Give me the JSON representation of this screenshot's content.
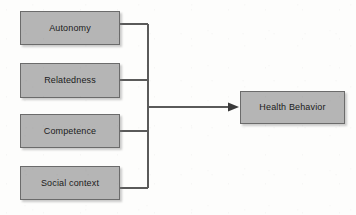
{
  "diagram": {
    "type": "flow-diagram",
    "background_color": "#fdfdfc",
    "node_fill_color": "#b5b5b5",
    "node_border_color": "#6b6b6b",
    "connector_color": "#5a5a5a",
    "text_color": "#1b1b1b",
    "sources": [
      {
        "id": "autonomy",
        "label": "Autonomy",
        "x": 20,
        "y": 11,
        "width": 100,
        "height": 34
      },
      {
        "id": "relatedness",
        "label": "Relatedness",
        "x": 20,
        "y": 63,
        "width": 100,
        "height": 35
      },
      {
        "id": "competence",
        "label": "Competence",
        "x": 20,
        "y": 114,
        "width": 100,
        "height": 34
      },
      {
        "id": "social-context",
        "label": "Social context",
        "x": 20,
        "y": 166,
        "width": 100,
        "height": 34
      }
    ],
    "target": {
      "id": "health-behavior",
      "label": "Health Behavior",
      "x": 240,
      "y": 91,
      "width": 105,
      "height": 33
    },
    "connectors": {
      "trunk_x": 148,
      "trunk_top_y": 24,
      "trunk_bottom_y": 188,
      "arrow_y": 107,
      "arrow_start_x": 148,
      "arrow_end_x": 239,
      "stub_start_x": 120,
      "stub_y_values": [
        24,
        80,
        131,
        188
      ]
    }
  }
}
